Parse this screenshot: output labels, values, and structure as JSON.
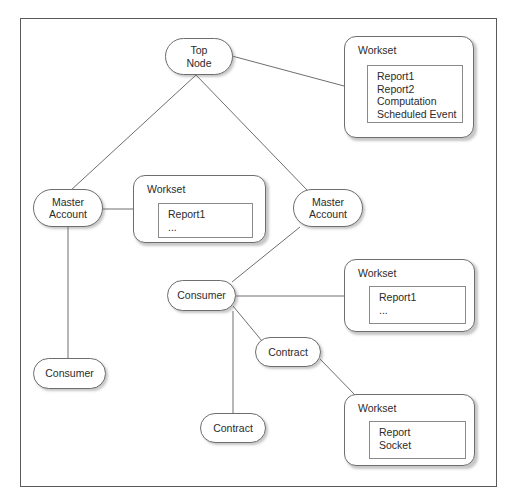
{
  "diagram": {
    "stroke_color": "#6e6e6e",
    "text_color": "#2b2b2b",
    "background_color": "#ffffff",
    "frame_color": "#5a5a5a"
  },
  "nodes": [
    {
      "id": "top-node",
      "label": "Top\nNode",
      "x": 165,
      "y": 38,
      "w": 68,
      "h": 37
    },
    {
      "id": "master-account-left",
      "label": "Master\nAccount",
      "x": 33,
      "y": 189,
      "w": 70,
      "h": 38
    },
    {
      "id": "master-account-right",
      "label": "Master\nAccount",
      "x": 293,
      "y": 189,
      "w": 70,
      "h": 38
    },
    {
      "id": "consumer-center",
      "label": "Consumer",
      "x": 167,
      "y": 280,
      "w": 69,
      "h": 31
    },
    {
      "id": "consumer-bottom",
      "label": "Consumer",
      "x": 33,
      "y": 358,
      "w": 73,
      "h": 31
    },
    {
      "id": "contract-upper",
      "label": "Contract",
      "x": 255,
      "y": 337,
      "w": 66,
      "h": 30
    },
    {
      "id": "contract-lower",
      "label": "Contract",
      "x": 200,
      "y": 413,
      "w": 66,
      "h": 30
    }
  ],
  "worksets": [
    {
      "id": "workset-top-right",
      "title": "Workset",
      "x": 344,
      "y": 36,
      "w": 130,
      "h": 102,
      "inner": {
        "x": 22,
        "y": 28,
        "w": 96,
        "h": 58
      },
      "items": [
        "Report1",
        "Report2",
        "Computation",
        "Scheduled Event"
      ]
    },
    {
      "id": "workset-middle-left",
      "title": "Workset",
      "x": 133,
      "y": 175,
      "w": 133,
      "h": 68,
      "inner": {
        "x": 24,
        "y": 27,
        "w": 95,
        "h": 35
      },
      "items": [
        "Report1",
        "..."
      ]
    },
    {
      "id": "workset-middle-right",
      "title": "Workset",
      "x": 344,
      "y": 259,
      "w": 131,
      "h": 73,
      "inner": {
        "x": 24,
        "y": 26,
        "w": 97,
        "h": 38
      },
      "items": [
        "Report1",
        "..."
      ]
    },
    {
      "id": "workset-bottom-right",
      "title": "Workset",
      "x": 344,
      "y": 394,
      "w": 131,
      "h": 72,
      "inner": {
        "x": 24,
        "y": 26,
        "w": 97,
        "h": 38
      },
      "items": [
        "Report",
        "Socket"
      ]
    }
  ],
  "edges": [
    {
      "id": "edge-top-node-to-workset-top-right",
      "from": "top-node",
      "to": "workset-top-right",
      "x1": 232,
      "y1": 56,
      "x2": 344,
      "y2": 86
    },
    {
      "id": "edge-top-node-to-master-left",
      "from": "top-node",
      "to": "master-account-left",
      "x1": 196,
      "y1": 75,
      "x2": 70,
      "y2": 191
    },
    {
      "id": "edge-top-node-to-master-right",
      "from": "top-node",
      "to": "master-account-right",
      "x1": 196,
      "y1": 75,
      "x2": 308,
      "y2": 191
    },
    {
      "id": "edge-master-left-to-workset-middle",
      "from": "master-account-left",
      "to": "workset-middle-left",
      "x1": 103,
      "y1": 209,
      "x2": 133,
      "y2": 209
    },
    {
      "id": "edge-master-left-to-consumer-bottom",
      "from": "master-account-left",
      "to": "consumer-bottom",
      "x1": 68,
      "y1": 227,
      "x2": 68,
      "y2": 358
    },
    {
      "id": "edge-master-right-to-consumer",
      "from": "master-account-right",
      "to": "consumer-center",
      "x1": 300,
      "y1": 227,
      "x2": 232,
      "y2": 282
    },
    {
      "id": "edge-consumer-to-workset-right",
      "from": "consumer-center",
      "to": "workset-middle-right",
      "x1": 236,
      "y1": 296,
      "x2": 344,
      "y2": 296
    },
    {
      "id": "edge-consumer-to-contract-upper",
      "from": "consumer-center",
      "to": "contract-upper",
      "x1": 233,
      "y1": 306,
      "x2": 262,
      "y2": 341
    },
    {
      "id": "edge-consumer-to-contract-lower",
      "from": "consumer-center",
      "to": "contract-lower",
      "x1": 233,
      "y1": 311,
      "x2": 233,
      "y2": 413
    },
    {
      "id": "edge-contract-upper-to-workset-bottom",
      "from": "contract-upper",
      "to": "workset-bottom-right",
      "x1": 320,
      "y1": 359,
      "x2": 356,
      "y2": 396
    }
  ]
}
